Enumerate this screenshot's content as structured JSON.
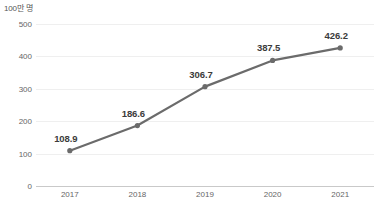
{
  "chart_data": {
    "type": "line",
    "title": "",
    "unit_label": "100만 명",
    "xlabel": "",
    "ylabel": "",
    "categories": [
      "2017",
      "2018",
      "2019",
      "2020",
      "2021"
    ],
    "values": [
      108.9,
      186.6,
      306.7,
      387.5,
      426.2
    ],
    "point_labels": [
      "108.9",
      "186.6",
      "306.7",
      "387.5",
      "426.2"
    ],
    "yticks": [
      0,
      100,
      200,
      300,
      400,
      500
    ],
    "ytick_labels": [
      "0",
      "100",
      "200",
      "300",
      "400",
      "500"
    ],
    "ylim": [
      0,
      500
    ],
    "grid": true,
    "legend": false,
    "series_color": "#6b6b6b",
    "grid_color": "#efefef",
    "axis_color": "#c9c9c9",
    "marker": "circle"
  },
  "source": {
    "note": ""
  }
}
